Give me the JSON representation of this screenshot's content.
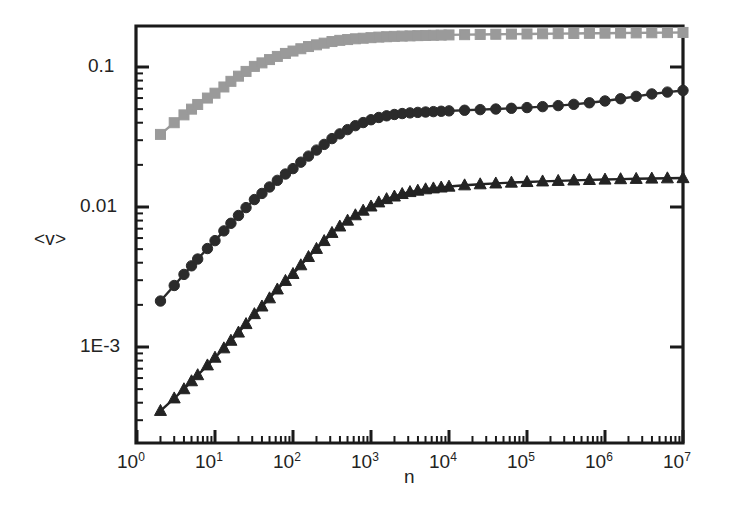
{
  "chart_data": {
    "type": "line",
    "title": "",
    "subtitle": "",
    "xlabel": "n",
    "ylabel": "<v>",
    "xscale": "log",
    "yscale": "log",
    "xlim": [
      1,
      10000000
    ],
    "ylim": [
      0.00022,
      0.22
    ],
    "grid": false,
    "legend": null,
    "xtick_labels": [
      "10^0",
      "10^1",
      "10^2",
      "10^3",
      "10^4",
      "10^5",
      "10^6",
      "10^7"
    ],
    "xtick_values": [
      1,
      10,
      100,
      1000,
      10000,
      100000,
      1000000,
      10000000
    ],
    "ytick_labels": [
      "0.1",
      "0.01",
      "1E-3"
    ],
    "ytick_values": [
      0.1,
      0.01,
      0.001
    ],
    "minor_ticks": true,
    "series": [
      {
        "name": "upper-series",
        "marker": "square",
        "color": "#9a9a9a",
        "line_color": "#9a9a9a",
        "x": [
          2,
          3,
          4,
          5,
          6,
          8,
          10,
          13,
          16,
          20,
          25,
          32,
          40,
          50,
          63,
          80,
          100,
          126,
          158,
          200,
          251,
          316,
          398,
          501,
          631,
          794,
          1000,
          1259,
          1585,
          1995,
          2512,
          3162,
          3981,
          5012,
          6310,
          7943,
          10000,
          15849,
          25119,
          39811,
          63096,
          100000,
          158489,
          251189,
          398107,
          630957,
          1000000,
          1584893,
          2511886,
          3981072,
          6309573,
          10000000
        ],
        "y": [
          0.033,
          0.04,
          0.0455,
          0.05,
          0.054,
          0.06,
          0.065,
          0.072,
          0.079,
          0.086,
          0.093,
          0.101,
          0.107,
          0.113,
          0.119,
          0.125,
          0.13,
          0.135,
          0.14,
          0.144,
          0.148,
          0.152,
          0.155,
          0.157,
          0.159,
          0.1605,
          0.162,
          0.1635,
          0.1645,
          0.1655,
          0.1662,
          0.1668,
          0.1675,
          0.168,
          0.1685,
          0.169,
          0.1695,
          0.1702,
          0.1708,
          0.1713,
          0.1718,
          0.1722,
          0.1727,
          0.1731,
          0.1736,
          0.174,
          0.1744,
          0.1748,
          0.1752,
          0.1756,
          0.176,
          0.1765
        ]
      },
      {
        "name": "middle-series",
        "marker": "circle",
        "color": "#2b2b2b",
        "line_color": "#2b2b2b",
        "x": [
          2,
          3,
          4,
          5,
          6,
          8,
          10,
          13,
          16,
          20,
          25,
          32,
          40,
          50,
          63,
          80,
          100,
          126,
          158,
          200,
          251,
          316,
          398,
          501,
          631,
          794,
          1000,
          1259,
          1585,
          1995,
          2512,
          3162,
          3981,
          5012,
          6310,
          7943,
          10000,
          15849,
          25119,
          39811,
          63096,
          100000,
          158489,
          251189,
          398107,
          630957,
          1000000,
          1584893,
          2511886,
          3981072,
          6309573,
          10000000
        ],
        "y": [
          0.00213,
          0.00275,
          0.0033,
          0.0038,
          0.00425,
          0.00505,
          0.00575,
          0.00675,
          0.00765,
          0.0087,
          0.0099,
          0.0113,
          0.0125,
          0.0139,
          0.0155,
          0.0172,
          0.0188,
          0.0209,
          0.0231,
          0.0255,
          0.028,
          0.0308,
          0.0333,
          0.0357,
          0.0381,
          0.0401,
          0.042,
          0.0436,
          0.0448,
          0.0458,
          0.0465,
          0.047,
          0.0474,
          0.0477,
          0.048,
          0.0483,
          0.0486,
          0.0491,
          0.0496,
          0.0501,
          0.0507,
          0.0513,
          0.0521,
          0.053,
          0.0541,
          0.0555,
          0.0572,
          0.0593,
          0.0617,
          0.0642,
          0.0662,
          0.068
        ]
      },
      {
        "name": "lower-series",
        "marker": "triangle",
        "color": "#232323",
        "line_color": "#232323",
        "x": [
          2,
          3,
          4,
          5,
          6,
          8,
          10,
          13,
          16,
          20,
          25,
          32,
          40,
          50,
          63,
          80,
          100,
          126,
          158,
          200,
          251,
          316,
          398,
          501,
          631,
          794,
          1000,
          1259,
          1585,
          1995,
          2512,
          3162,
          3981,
          5012,
          6310,
          7943,
          10000,
          15849,
          25119,
          39811,
          63096,
          100000,
          158489,
          251189,
          398107,
          630957,
          1000000,
          1584893,
          2511886,
          3981072,
          6309573,
          10000000
        ],
        "y": [
          0.00035,
          0.00043,
          0.0005,
          0.00057,
          0.00063,
          0.00074,
          0.00084,
          0.00098,
          0.00111,
          0.00127,
          0.00146,
          0.00172,
          0.00195,
          0.00223,
          0.00258,
          0.00297,
          0.00333,
          0.00384,
          0.0044,
          0.00503,
          0.00572,
          0.00654,
          0.00727,
          0.008,
          0.00874,
          0.00943,
          0.0101,
          0.0108,
          0.0114,
          0.0119,
          0.0124,
          0.0128,
          0.0131,
          0.0134,
          0.0136,
          0.0138,
          0.014,
          0.0143,
          0.01455,
          0.01475,
          0.01495,
          0.0151,
          0.01525,
          0.01538,
          0.0155,
          0.01562,
          0.01572,
          0.01582,
          0.0159,
          0.01598,
          0.01605,
          0.0161
        ]
      }
    ]
  },
  "axes": {
    "x_title": "n",
    "y_title": "<v>",
    "x_tick_labels": [
      {
        "base": "10",
        "exp": "0"
      },
      {
        "base": "10",
        "exp": "1"
      },
      {
        "base": "10",
        "exp": "2"
      },
      {
        "base": "10",
        "exp": "3"
      },
      {
        "base": "10",
        "exp": "4"
      },
      {
        "base": "10",
        "exp": "5"
      },
      {
        "base": "10",
        "exp": "6"
      },
      {
        "base": "10",
        "exp": "7"
      }
    ],
    "y_tick_labels": [
      "0.1",
      "0.01",
      "1E-3"
    ]
  },
  "colors": {
    "axis": "#1a1a1a",
    "upper_series": "#9a9a9a",
    "middle_series": "#2b2b2b",
    "lower_series": "#232323",
    "background": "#ffffff"
  }
}
